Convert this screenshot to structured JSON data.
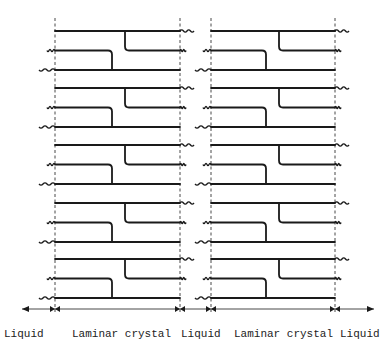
{
  "figure": {
    "panels": 2,
    "groups_per_panel": 5,
    "chains_per_group": 3,
    "regions": [
      {
        "id": "liquid-left",
        "label": "Liquid"
      },
      {
        "id": "crystal-1",
        "label": "Laminar crystal"
      },
      {
        "id": "liquid-middle",
        "label": "Liquid"
      },
      {
        "id": "crystal-2",
        "label": "Laminar crystal"
      },
      {
        "id": "liquid-right",
        "label": "Liquid"
      }
    ],
    "colors": {
      "line": "#1a1a1a",
      "background": "#ffffff"
    }
  }
}
